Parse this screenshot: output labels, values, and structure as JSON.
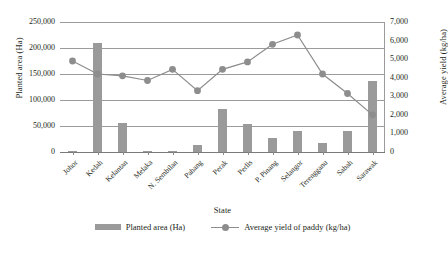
{
  "chart_data": {
    "type": "bar",
    "title": "",
    "xlabel": "State",
    "ylabel": "Planted area (Ha)",
    "y2label": "Average yield (kg/ha)",
    "categories": [
      "Johor",
      "Kedah",
      "Kelantan",
      "Melaka",
      "N. Sembilan",
      "Pahang",
      "Perak",
      "Perlis",
      "P. Pinang",
      "Selangor",
      "Terengganu",
      "Sabah",
      "Sarawak"
    ],
    "ylim": [
      0,
      250000
    ],
    "y2lim": [
      0,
      7000
    ],
    "yticks": [
      "0",
      "50,000",
      "100,000",
      "150,000",
      "200,000",
      "250,000"
    ],
    "y2ticks": [
      "0",
      "1,000",
      "2,000",
      "3,000",
      "4,000",
      "5,000",
      "6,000",
      "7,000"
    ],
    "grid": true,
    "legend_position": "bottom",
    "series": [
      {
        "name": "Planted area (Ha)",
        "type": "bar",
        "axis": "left",
        "color": "#9a9a9a",
        "values": [
          2000,
          210000,
          55000,
          1500,
          2500,
          14000,
          83000,
          54000,
          26000,
          41000,
          18000,
          40000,
          137000
        ]
      },
      {
        "name": "Average yield of paddy (kg/ha)",
        "type": "line",
        "axis": "right",
        "color": "#8d8d8d",
        "values": [
          4900,
          4200,
          4100,
          3850,
          4450,
          3300,
          4450,
          4850,
          5800,
          6300,
          4200,
          3150,
          2000
        ]
      }
    ]
  },
  "legend": {
    "bar_label": "Planted area (Ha)",
    "line_label": "Average yield of paddy (kg/ha)"
  },
  "axes": {
    "left_title": "Planted area (Ha)",
    "right_title": "Average yield (kg/ha)",
    "x_title": "State"
  }
}
